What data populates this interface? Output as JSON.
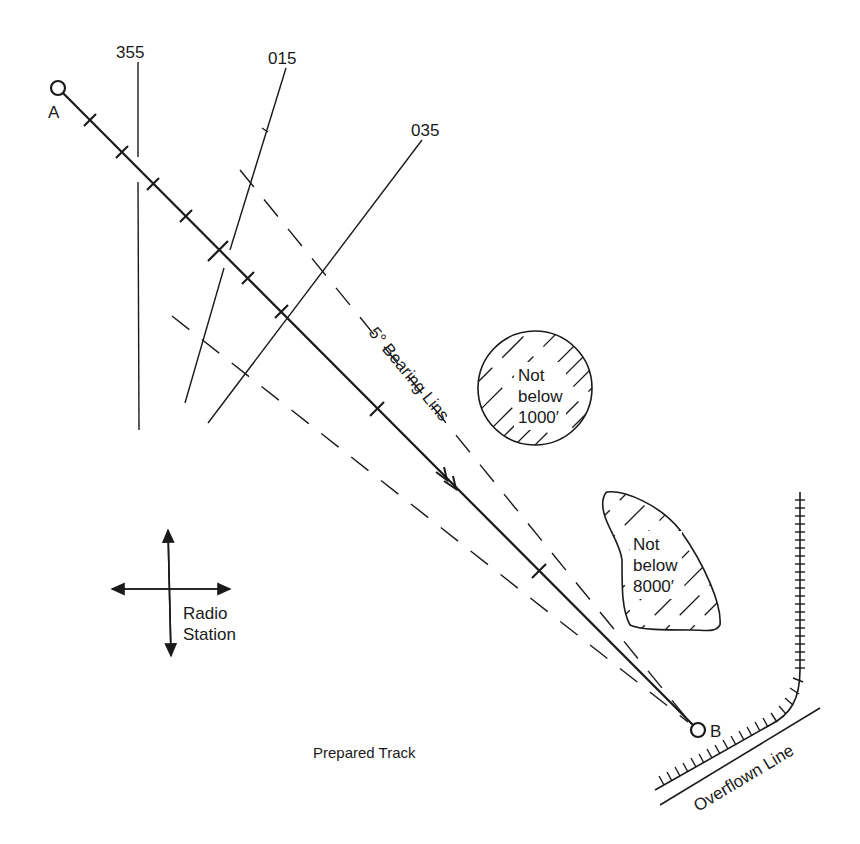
{
  "title": "Prepared Track",
  "waypoints": {
    "start": {
      "label": "A"
    },
    "end": {
      "label": "B"
    }
  },
  "bearing_lines": [
    {
      "label": "355"
    },
    {
      "label": "015"
    },
    {
      "label": "035"
    }
  ],
  "bearing_lines_annotation": "5° Bearing Lins",
  "restricted_areas": [
    {
      "line1": "Not",
      "line2": "below",
      "line3": "1000′"
    },
    {
      "line1": "Not",
      "line2": "below",
      "line3": "8000′"
    }
  ],
  "radio_station": {
    "line1": "Radio",
    "line2": "Station"
  },
  "overflown_line": {
    "label": "Overflown Line"
  },
  "colors": {
    "ink": "#1a1a1a",
    "background": "#ffffff"
  }
}
